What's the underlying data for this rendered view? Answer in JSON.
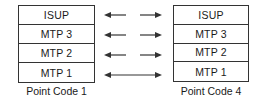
{
  "diagram": {
    "left_node": {
      "label": "Point Code 1",
      "layers": [
        "ISUP",
        "MTP 3",
        "MTP 2",
        "MTP 1"
      ]
    },
    "right_node": {
      "label": "Point Code 4",
      "layers": [
        "ISUP",
        "MTP 3",
        "MTP 2",
        "MTP 1"
      ]
    },
    "connections": [
      {
        "layer": "ISUP",
        "type": "peer-logical",
        "arrows": "split-bidirectional"
      },
      {
        "layer": "MTP 3",
        "type": "peer-logical",
        "arrows": "split-bidirectional"
      },
      {
        "layer": "MTP 2",
        "type": "peer-logical",
        "arrows": "split-bidirectional"
      },
      {
        "layer": "MTP 1",
        "type": "physical",
        "arrows": "continuous-bidirectional"
      }
    ],
    "colors": {
      "line": "#333333",
      "text": "#1a1a1a",
      "background": "#ffffff"
    }
  }
}
